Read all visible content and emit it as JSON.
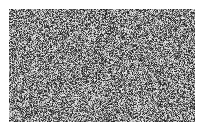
{
  "canvas": {
    "width": 204,
    "height": 131,
    "background_color": "#ffffff"
  },
  "noise_field": {
    "label": "grayscale-random-noise",
    "x": 9,
    "y": 9,
    "width": 186,
    "height": 113,
    "grain_size": 1,
    "mean_gray": "#8a8a8a",
    "min_gray": "#1a1a1a",
    "max_gray": "#f0f0f0",
    "min_level": 26,
    "max_level": 240,
    "distribution": "uniform",
    "seed": 20394
  }
}
